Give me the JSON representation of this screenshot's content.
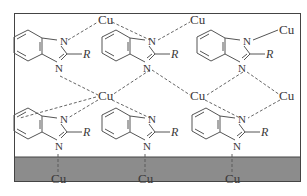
{
  "diagram": {
    "colors": {
      "line": "#555555",
      "frame": "#444444",
      "substrate": "#8c8c8c",
      "text": "#3a3a3a",
      "background": "#ffffff"
    },
    "atom_labels": {
      "metal": "Cu",
      "nitrogen": "N",
      "substituent": "R"
    },
    "molecules": [
      {
        "id": "m1",
        "row": 1,
        "col": 1,
        "label_N1": "N",
        "label_N3": "N",
        "label_R": "R"
      },
      {
        "id": "m2",
        "row": 1,
        "col": 2,
        "label_N1": "N",
        "label_N3": "N",
        "label_R": "R"
      },
      {
        "id": "m3",
        "row": 1,
        "col": 3,
        "label_N1": "N",
        "label_N3": "N",
        "label_R": "R"
      },
      {
        "id": "m4",
        "row": 2,
        "col": 1,
        "label_N1": "N",
        "label_N3": "N",
        "label_R": "R"
      },
      {
        "id": "m5",
        "row": 2,
        "col": 2,
        "label_N1": "N",
        "label_N3": "N",
        "label_R": "R"
      },
      {
        "id": "m6",
        "row": 2,
        "col": 3,
        "label_N1": "N",
        "label_N3": "N",
        "label_R": "R"
      }
    ],
    "cu_atoms": [
      {
        "id": "cu_top_1",
        "label": "Cu"
      },
      {
        "id": "cu_top_2",
        "label": "Cu"
      },
      {
        "id": "cu_right_top",
        "label": "Cu"
      },
      {
        "id": "cu_mid_1",
        "label": "Cu"
      },
      {
        "id": "cu_mid_2",
        "label": "Cu"
      },
      {
        "id": "cu_right_mid",
        "label": "Cu"
      },
      {
        "id": "cu_surface_1",
        "label": "Cu"
      },
      {
        "id": "cu_surface_2",
        "label": "Cu"
      },
      {
        "id": "cu_surface_3",
        "label": "Cu"
      }
    ],
    "substrate": {
      "label": "Cu surface"
    }
  }
}
